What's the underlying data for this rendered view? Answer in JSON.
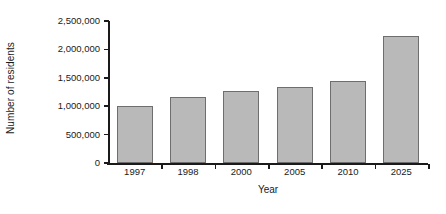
{
  "chart_data": {
    "type": "bar",
    "title": "",
    "xlabel": "Year",
    "ylabel": "Number of residents",
    "categories": [
      "1997",
      "1998",
      "2000",
      "2005",
      "2010",
      "2025"
    ],
    "values": [
      1000000,
      1170000,
      1270000,
      1340000,
      1450000,
      2240000
    ],
    "ylim": [
      0,
      2500000
    ],
    "ytick_values": [
      0,
      500000,
      1000000,
      1500000,
      2000000,
      2500000
    ],
    "ytick_labels": [
      "0",
      "500,000",
      "1,000,000",
      "1,500,000",
      "2,000,000",
      "2,500,000"
    ],
    "grid": false,
    "legend": null,
    "bar_color": "#b9b9b9",
    "bar_edge_color": "#6e6e6e",
    "axis_color": "#1a1a1a",
    "background_color": "#ffffff"
  }
}
